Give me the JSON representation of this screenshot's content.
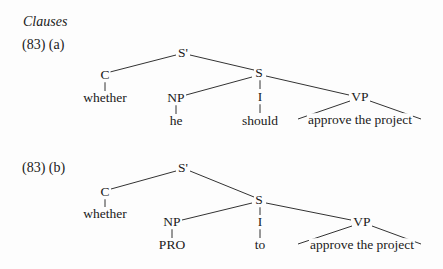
{
  "section_title": "Clauses",
  "examples": [
    {
      "label": "(83) (a)",
      "nodes": {
        "root": "S'",
        "comp": "C",
        "comp_word": "whether",
        "s": "S",
        "np": "NP",
        "np_word": "he",
        "infl": "I",
        "infl_word": "should",
        "vp": "VP",
        "vp_words": "approve the project"
      }
    },
    {
      "label": "(83) (b)",
      "nodes": {
        "root": "S'",
        "comp": "C",
        "comp_word": "whether",
        "s": "S",
        "np": "NP",
        "np_word": "PRO",
        "infl": "I",
        "infl_word": "to",
        "vp": "VP",
        "vp_words": "approve the project"
      }
    }
  ]
}
